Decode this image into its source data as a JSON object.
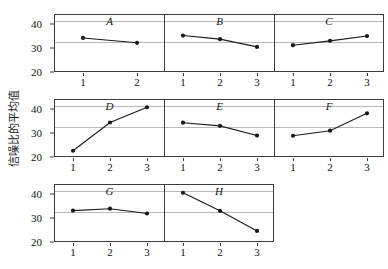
{
  "chart_data": {
    "type": "line",
    "title": "",
    "xlabel": "",
    "ylabel": "信噪比的平均值",
    "ylim": [
      20,
      44
    ],
    "yticks": [
      20,
      30,
      40
    ],
    "ytick_labels": [
      "20",
      "30",
      "40"
    ],
    "gridlines": [
      41.5,
      33.0
    ],
    "grid": true,
    "legend": "none",
    "layout": "facet-grid 3x3 (8 panels used)",
    "panels": [
      {
        "label": "A",
        "row": 0,
        "col": 0,
        "x": [
          1,
          2
        ],
        "xtick_labels": [
          "1",
          "2"
        ],
        "values": [
          34.5,
          32.5
        ]
      },
      {
        "label": "B",
        "row": 0,
        "col": 1,
        "x": [
          1,
          2,
          3
        ],
        "xtick_labels": [
          "1",
          "2",
          "3"
        ],
        "values": [
          35.5,
          34.0,
          30.8
        ]
      },
      {
        "label": "C",
        "row": 0,
        "col": 2,
        "x": [
          1,
          2,
          3
        ],
        "xtick_labels": [
          "1",
          "2",
          "3"
        ],
        "values": [
          31.5,
          33.3,
          35.3
        ]
      },
      {
        "label": "D",
        "row": 1,
        "col": 0,
        "x": [
          1,
          2,
          3
        ],
        "xtick_labels": [
          "1",
          "2",
          "3"
        ],
        "values": [
          23.0,
          34.7,
          41.0
        ]
      },
      {
        "label": "E",
        "row": 1,
        "col": 1,
        "x": [
          1,
          2,
          3
        ],
        "xtick_labels": [
          "1",
          "2",
          "3"
        ],
        "values": [
          34.6,
          33.3,
          29.3
        ]
      },
      {
        "label": "F",
        "row": 1,
        "col": 2,
        "x": [
          1,
          2,
          3
        ],
        "xtick_labels": [
          "1",
          "2",
          "3"
        ],
        "values": [
          29.2,
          31.3,
          38.5
        ]
      },
      {
        "label": "G",
        "row": 2,
        "col": 0,
        "x": [
          1,
          2,
          3
        ],
        "xtick_labels": [
          "1",
          "2",
          "3"
        ],
        "values": [
          33.4,
          34.2,
          32.2
        ]
      },
      {
        "label": "H",
        "row": 2,
        "col": 1,
        "x": [
          1,
          2,
          3
        ],
        "xtick_labels": [
          "1",
          "2",
          "3"
        ],
        "values": [
          40.8,
          33.3,
          25.0
        ]
      }
    ],
    "style": {
      "line_color": "#1a1a1a",
      "marker_color": "#1a1a1a",
      "marker": "circle",
      "panel_border_color": "#3c3c3c",
      "gridline_color": "#b9b9b9",
      "background": "#ffffff"
    }
  }
}
